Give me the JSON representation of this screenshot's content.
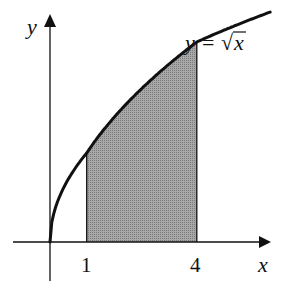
{
  "diagram": {
    "curve_label": {
      "lhs": "y",
      "equals": "=",
      "radical": "√",
      "radicand": "x"
    },
    "axes": {
      "x_label": "x",
      "y_label": "y"
    },
    "ticks": [
      {
        "value": 1,
        "label": "1"
      },
      {
        "value": 4,
        "label": "4"
      }
    ],
    "shaded_region": {
      "from": 1,
      "to": 4,
      "fill": "#9a9a9a"
    },
    "curve_points": [
      [
        0,
        0
      ],
      [
        0.25,
        0.5
      ],
      [
        0.5,
        0.707
      ],
      [
        1,
        1
      ],
      [
        1.5,
        1.225
      ],
      [
        2,
        1.414
      ],
      [
        2.5,
        1.581
      ],
      [
        3,
        1.732
      ],
      [
        3.5,
        1.871
      ],
      [
        4,
        2
      ],
      [
        5,
        2.236
      ],
      [
        6,
        2.449
      ]
    ],
    "colors": {
      "ink": "#111111",
      "shade": "#9a9a9a"
    }
  }
}
